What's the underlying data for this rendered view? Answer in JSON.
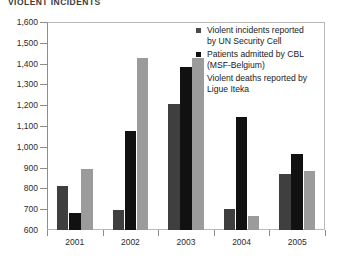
{
  "chart_data": {
    "type": "bar",
    "title": "VIOLENT INCIDENTS",
    "xlabel": "",
    "ylabel": "",
    "ylim": [
      600,
      1600
    ],
    "ytick_step": 100,
    "grid": false,
    "legend_position": "top-right",
    "categories": [
      "2001",
      "2002",
      "2003",
      "2004",
      "2005"
    ],
    "ytick_labels": [
      "600",
      "700",
      "800",
      "900",
      "1,000",
      "1,100",
      "1,200",
      "1,300",
      "1,400",
      "1,500",
      "1,600"
    ],
    "series": [
      {
        "name": "Violent incidents reported by UN Security Cell",
        "color": "#3f3f3f",
        "values": [
          810,
          695,
          1205,
          700,
          870
        ]
      },
      {
        "name": "Patients admitted by CBL (MSF-Belgium)",
        "color": "#111111",
        "values": [
          680,
          1075,
          1385,
          1145,
          965
        ]
      },
      {
        "name": "Violent deaths reported by Ligue Iteka",
        "color": "#9b9b9b",
        "values": [
          895,
          1425,
          1425,
          665,
          885
        ]
      }
    ]
  },
  "legend": {
    "items": [
      {
        "line1": "Violent incidents reported",
        "line2": "by UN Security Cell",
        "swatch": "#4a4a4a"
      },
      {
        "line1": "Patients admitted by CBL",
        "line2": "(MSF-Belgium)",
        "swatch": "#111111"
      },
      {
        "line1": "Violent deaths reported by",
        "line2": "Ligue Iteka",
        "swatch": "#9b9b9b"
      }
    ]
  }
}
